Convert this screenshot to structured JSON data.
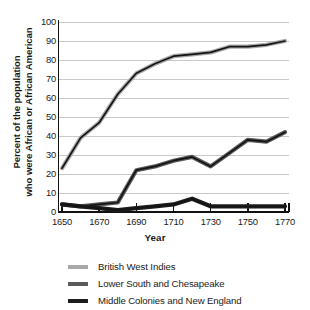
{
  "chart_data": {
    "type": "line",
    "title": "",
    "xlabel": "Year",
    "ylabel": "Percent of the population who were African or African American",
    "ylabel_line1": "Percent of the population",
    "ylabel_line2": "who were African or African American",
    "xlim": [
      1650,
      1770
    ],
    "ylim": [
      0,
      100
    ],
    "grid": true,
    "legend_position": "bottom",
    "xticks": [
      1650,
      1670,
      1690,
      1710,
      1730,
      1750,
      1770
    ],
    "xtick_labels": [
      "1650",
      "1670",
      "1690",
      "1710",
      "1730",
      "1750",
      "1770"
    ],
    "yticks": [
      0,
      10,
      20,
      30,
      40,
      50,
      60,
      70,
      80,
      90,
      100
    ],
    "ytick_labels": [
      "0",
      "10",
      "20",
      "30",
      "40",
      "50",
      "60",
      "70",
      "80",
      "90",
      "100"
    ],
    "x": [
      1650,
      1660,
      1670,
      1680,
      1690,
      1700,
      1710,
      1720,
      1730,
      1740,
      1750,
      1760,
      1770
    ],
    "series": [
      {
        "name": "British West Indies",
        "color": "#a8a8a8",
        "values": [
          23,
          39,
          47,
          62,
          73,
          78,
          82,
          83,
          84,
          87,
          87,
          88,
          90
        ]
      },
      {
        "name": "Lower South and Chesapeake",
        "color": "#5a5a5a",
        "values": [
          4,
          3,
          4,
          5,
          22,
          24,
          27,
          29,
          24,
          31,
          38,
          37,
          42
        ]
      },
      {
        "name": "Middle Colonies and New England",
        "color": "#1c1c1c",
        "values": [
          4,
          3,
          2,
          1,
          2,
          3,
          4,
          7,
          3,
          3,
          3,
          3,
          3
        ]
      }
    ]
  },
  "axes": {
    "xtitle": "Year"
  },
  "legend": {
    "items": [
      {
        "label": "British West Indies",
        "color": "#a8a8a8"
      },
      {
        "label": "Lower South and Chesapeake",
        "color": "#5a5a5a"
      },
      {
        "label": "Middle Colonies and New England",
        "color": "#1c1c1c"
      }
    ]
  },
  "colors": {
    "background": "#ffffff",
    "gridline": "#c9c9c9",
    "axis": "#111111",
    "text": "#1a1a1a"
  }
}
